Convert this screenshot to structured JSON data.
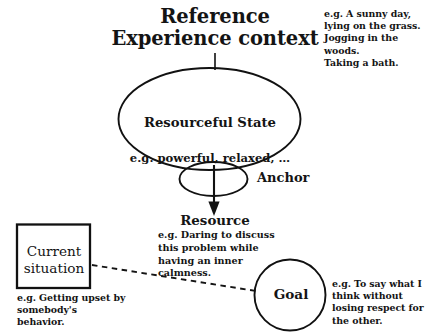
{
  "diagram": {
    "title": "Reference Experience\ncontext",
    "background_color": "#ffffff",
    "stroke_color": "#111111",
    "text_color": "#141414",
    "nodes": {
      "reference_experience": {
        "label": "Reference Experience context",
        "note": "e.g. A sunny day, lying on the grass.\nJogging in the woods.\nTaking a bath."
      },
      "resourceful_state": {
        "title": "Resourceful State",
        "subtitle": "e.g. powerful, relaxed, …",
        "shape": "ellipse"
      },
      "anchor": {
        "label": "Anchor",
        "shape": "small-ellipse"
      },
      "resource": {
        "title": "Resource",
        "subtitle": "e.g. Daring to discuss this problem while having an inner calmness."
      },
      "current_situation": {
        "label": "Current\nsituation",
        "shape": "rectangle",
        "note": "e.g. Getting upset by somebody's behavior."
      },
      "goal": {
        "label": "Goal",
        "shape": "circle",
        "note": "e.g. To say what I think without losing respect for the other."
      }
    },
    "connectors": {
      "title_to_ellipse": "solid-line",
      "anchor_to_resource": "solid-arrow",
      "current_situation_to_goal": "dashed-line"
    }
  }
}
